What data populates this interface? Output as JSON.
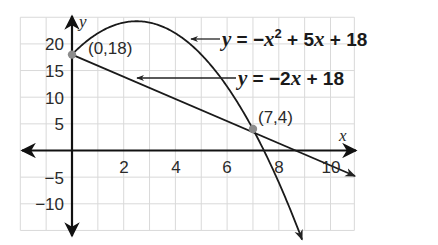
{
  "chart_data": {
    "type": "line",
    "title": "",
    "xlabel": "x",
    "ylabel": "y",
    "xlim": [
      -2,
      11
    ],
    "ylim": [
      -15,
      25
    ],
    "grid": true,
    "x_grid_step": 1,
    "y_grid_step": 5,
    "x_ticks": [
      2,
      4,
      6,
      8,
      10
    ],
    "x_tick_labels": [
      "2",
      "4",
      "6",
      "8",
      "10"
    ],
    "y_ticks": [
      20,
      15,
      10,
      5,
      -5,
      -10
    ],
    "y_tick_labels": [
      "20",
      "15",
      "10",
      "5",
      "−5",
      "−10"
    ],
    "series": [
      {
        "name": "parabola",
        "equation": "y = −x² + 5x + 18",
        "function": "-x^2+5x+18",
        "x": [
          0,
          1,
          2,
          2.5,
          3,
          4,
          5,
          6,
          7,
          8,
          9
        ],
        "values": [
          18,
          22,
          24,
          24.25,
          24,
          22,
          18,
          12,
          4,
          -6,
          -18
        ]
      },
      {
        "name": "line",
        "equation": "y = −2x + 18",
        "function": "-2x+18",
        "x": [
          0,
          7,
          9,
          10.6
        ],
        "values": [
          18,
          4,
          0,
          -3.2
        ]
      }
    ],
    "points": [
      {
        "label": "(0,18)",
        "x": 0,
        "y": 18
      },
      {
        "label": "(7,4)",
        "x": 7,
        "y": 4
      }
    ],
    "annotations": [
      {
        "text": "y = −x² + 5x + 18",
        "points_to": "parabola"
      },
      {
        "text": "y = −2x + 18",
        "points_to": "line"
      }
    ]
  },
  "labels": {
    "x_axis": "x",
    "y_axis": "y",
    "eq1": {
      "y": "y",
      "eq": " = −",
      "x": "x",
      "sup": "2",
      "rest1": " + 5",
      "x2": "x",
      "rest2": " + 18"
    },
    "eq2": {
      "y": "y",
      "eq": " = −2",
      "x": "x",
      "rest": " + 18"
    },
    "point1": "(0,18)",
    "point2": "(7,4)",
    "ticks_x": [
      "2",
      "4",
      "6",
      "8",
      "10"
    ],
    "ticks_y": [
      "20",
      "15",
      "10",
      "5",
      "−5",
      "−10"
    ]
  },
  "colors": {
    "grid": "#d9d9d9",
    "axis": "#111111",
    "curve": "#1a1a1a",
    "point": "#8c8c8c"
  }
}
